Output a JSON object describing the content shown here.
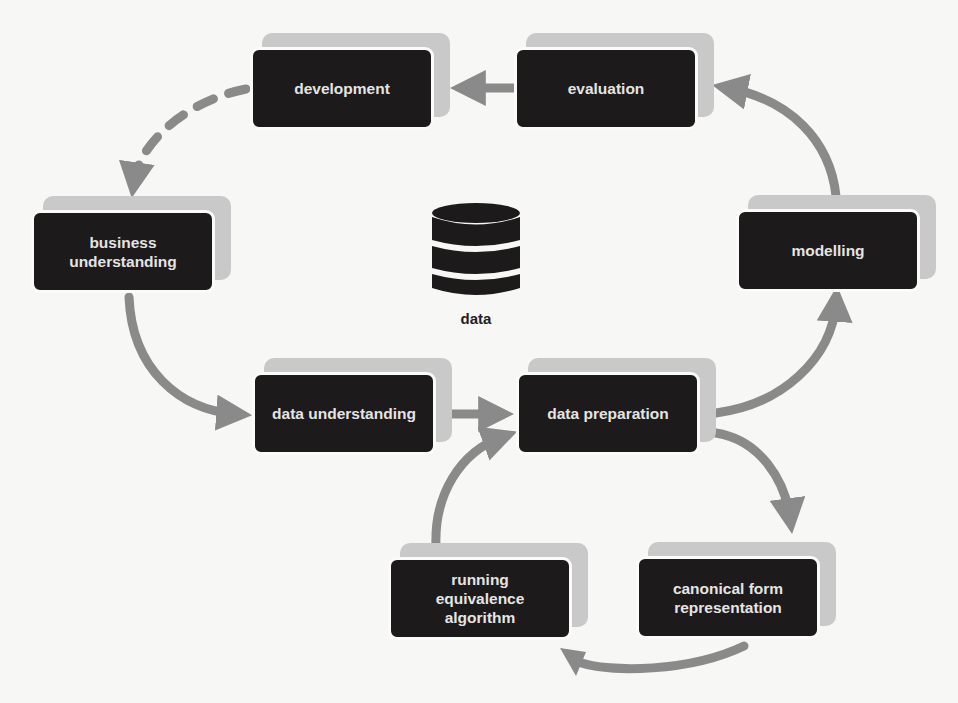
{
  "diagram": {
    "type": "process-cycle",
    "nodes": {
      "development": {
        "label": "development"
      },
      "evaluation": {
        "label": "evaluation"
      },
      "business_understanding": {
        "label": "business\nunderstanding"
      },
      "modelling": {
        "label": "modelling"
      },
      "data_understanding": {
        "label": "data understanding"
      },
      "data_preparation": {
        "label": "data preparation"
      },
      "running_equivalence_algorithm": {
        "label": "running\nequivalence\nalgorithm"
      },
      "canonical_form_representation": {
        "label": "canonical form\nrepresentation"
      }
    },
    "data_store": {
      "label": "data",
      "icon": "database-icon"
    },
    "edges": [
      {
        "from": "evaluation",
        "to": "development",
        "style": "solid"
      },
      {
        "from": "modelling",
        "to": "evaluation",
        "style": "solid"
      },
      {
        "from": "development",
        "to": "business understanding",
        "style": "dashed"
      },
      {
        "from": "business understanding",
        "to": "data understanding",
        "style": "solid"
      },
      {
        "from": "data understanding",
        "to": "data preparation",
        "style": "solid"
      },
      {
        "from": "data preparation",
        "to": "modelling",
        "style": "solid"
      },
      {
        "from": "data preparation",
        "to": "canonical form representation",
        "style": "solid"
      },
      {
        "from": "canonical form representation",
        "to": "running equivalence algorithm",
        "style": "solid"
      },
      {
        "from": "running equivalence algorithm",
        "to": "data preparation",
        "style": "solid"
      }
    ],
    "colors": {
      "node_fill": "#1c1a1a",
      "node_text": "#e4e4e4",
      "node_plate": "#c9c9c9",
      "arrow": "#8a8a8a",
      "background": "#f7f7f5"
    }
  }
}
